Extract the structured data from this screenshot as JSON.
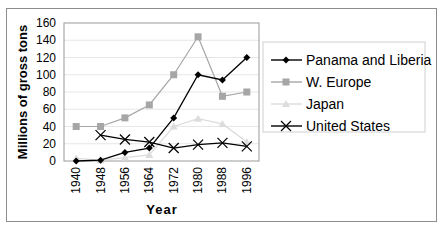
{
  "chart_data": {
    "type": "line",
    "title": "",
    "xlabel": "Year",
    "ylabel": "Millions of gross tons",
    "ylim": [
      0,
      160
    ],
    "yticks": [
      0,
      20,
      40,
      60,
      80,
      100,
      120,
      140,
      160
    ],
    "grid": true,
    "legend_position": "right",
    "categories": [
      "1940",
      "1948",
      "1956",
      "1964",
      "1972",
      "1980",
      "1988",
      "1996"
    ],
    "series": [
      {
        "name": "Panama and Liberia",
        "color": "#000000",
        "marker": "diamond",
        "values": [
          0,
          1,
          10,
          15,
          50,
          100,
          94,
          120
        ]
      },
      {
        "name": "W. Europe",
        "color": "#a6a6a6",
        "marker": "square",
        "values": [
          40,
          40,
          50,
          65,
          100,
          144,
          75,
          80
        ]
      },
      {
        "name": "Japan",
        "color": "#dcdcdc",
        "marker": "triangle",
        "values": [
          3,
          1,
          4,
          7,
          40,
          49,
          43,
          22
        ]
      },
      {
        "name": "United States",
        "color": "#000000",
        "marker": "x",
        "values": [
          null,
          30,
          25,
          22,
          15,
          19,
          21,
          17
        ]
      }
    ]
  }
}
